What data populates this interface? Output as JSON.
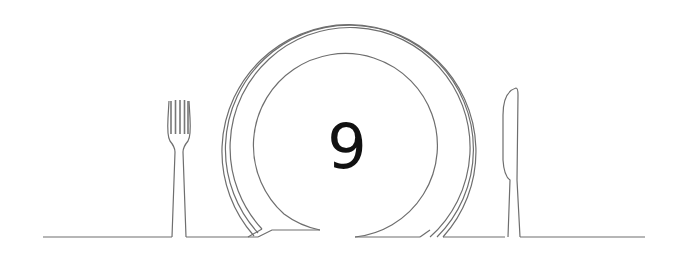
{
  "illustration": {
    "number": "9",
    "icons": [
      "fork-icon",
      "plate-icon",
      "knife-icon"
    ],
    "line_color": "#6e6e6e",
    "text_color": "#111111",
    "background": "#ffffff"
  }
}
